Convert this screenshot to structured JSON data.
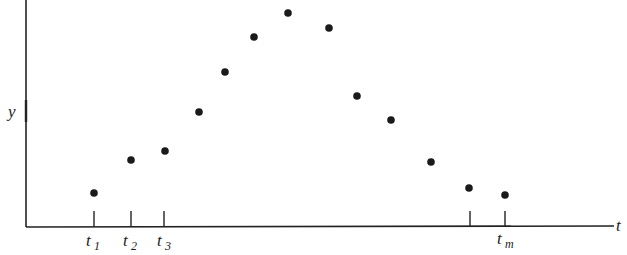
{
  "chart_data": {
    "type": "scatter",
    "title": "",
    "xlabel": "t",
    "ylabel": "y",
    "grid": false,
    "legend": null,
    "x_tick_labels": [
      "t_1",
      "t_2",
      "t_3",
      "",
      "t_m"
    ],
    "x_tick_positions_px": [
      94,
      131,
      164,
      470,
      505
    ],
    "points_px": [
      {
        "x": 94,
        "y": 193
      },
      {
        "x": 131,
        "y": 160
      },
      {
        "x": 165,
        "y": 151
      },
      {
        "x": 199,
        "y": 112
      },
      {
        "x": 225,
        "y": 72
      },
      {
        "x": 254,
        "y": 37
      },
      {
        "x": 288,
        "y": 13
      },
      {
        "x": 329,
        "y": 28
      },
      {
        "x": 357,
        "y": 96
      },
      {
        "x": 391,
        "y": 120
      },
      {
        "x": 431,
        "y": 162
      },
      {
        "x": 469,
        "y": 188
      },
      {
        "x": 505,
        "y": 195
      }
    ],
    "x": [
      1,
      2,
      3,
      4,
      5,
      6,
      7,
      8,
      9,
      10,
      11,
      12,
      13
    ],
    "values": [
      34,
      67,
      76,
      115,
      155,
      190,
      214,
      199,
      131,
      107,
      65,
      39,
      32
    ],
    "axis_origin_px": {
      "x": 26,
      "y": 227
    },
    "xlim_px": [
      26,
      615
    ],
    "ylim_px": [
      0,
      227
    ],
    "annotations": [
      "y-axis midpoint tick beside label y"
    ]
  },
  "labels": {
    "y_axis": "y",
    "x_axis": "t",
    "t1_base": "t",
    "t1_sub": "1",
    "t2_base": "t",
    "t2_sub": "2",
    "t3_base": "t",
    "t3_sub": "3",
    "tm_base": "t",
    "tm_sub": "m"
  }
}
